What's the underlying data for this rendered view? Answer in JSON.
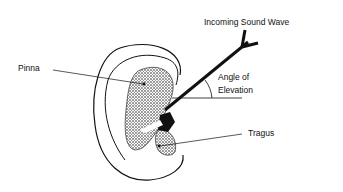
{
  "diagram": {
    "labels": {
      "incoming": "Incoming Sound Wave",
      "pinna": "Pinna",
      "angle_line1": "Angle of",
      "angle_line2": "Elevation",
      "tragus": "Tragus"
    }
  }
}
